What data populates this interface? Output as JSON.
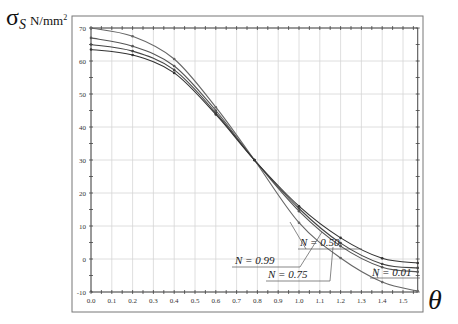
{
  "chart_data": {
    "type": "line",
    "title": "",
    "xlabel": "θ",
    "ylabel": "σS",
    "yunit": "N/mm²",
    "xlim": [
      0.0,
      1.5708
    ],
    "ylim": [
      -10,
      70
    ],
    "grid": true,
    "x_ticks": [
      "0.0",
      "0.1",
      "0.2",
      "0.3",
      "0.4",
      "0.5",
      "0.6",
      "0.7",
      "0.8",
      "0.9",
      "1.0",
      "1.1",
      "1.2",
      "1.3",
      "1.4",
      "1.5"
    ],
    "y_ticks": [
      "-10",
      "0",
      "10",
      "20",
      "30",
      "40",
      "50",
      "60",
      "70"
    ],
    "x": [
      0.0,
      0.2,
      0.4,
      0.6,
      0.7854,
      1.0,
      1.2,
      1.4,
      1.5708
    ],
    "series": [
      {
        "name": "N = 0.99",
        "values": [
          70.0,
          67.5,
          60.6,
          46.0,
          30.0,
          11.0,
          0.3,
          -7.0,
          -9.7
        ]
      },
      {
        "name": "N = 0.75",
        "values": [
          67.0,
          64.5,
          58.5,
          45.0,
          30.0,
          14.5,
          3.9,
          -2.5,
          -3.9
        ]
      },
      {
        "name": "N = 0.50",
        "values": [
          65.0,
          63.0,
          57.3,
          44.3,
          30.0,
          15.3,
          4.8,
          -1.5,
          -2.7
        ]
      },
      {
        "name": "N = 0.01",
        "values": [
          63.5,
          61.8,
          56.4,
          43.8,
          30.0,
          16.0,
          6.4,
          0.2,
          -1.2
        ]
      }
    ],
    "annotations": [
      {
        "text": "N = 0.50",
        "target_series": "N = 0.50"
      },
      {
        "text": "N = 0.01",
        "target_series": "N = 0.01"
      },
      {
        "text": "N = 0.99",
        "target_series": "N = 0.99"
      },
      {
        "text": "N = 0.75",
        "target_series": "N = 0.75"
      }
    ],
    "legend_position": "inline leader-line labels, lower right"
  },
  "labels": {
    "y_symbol": "σ",
    "y_subscript": "S",
    "y_unit": "N/mm",
    "y_unit_sup": "2",
    "x_symbol": "θ"
  }
}
